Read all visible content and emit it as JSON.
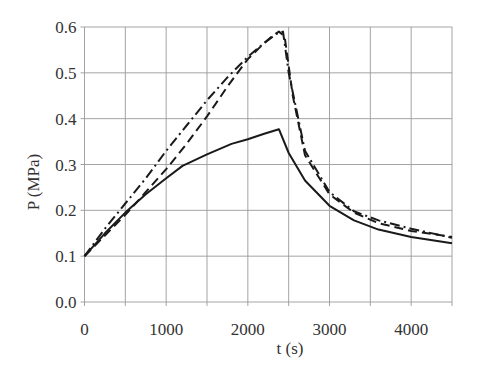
{
  "chart_data": {
    "type": "line",
    "title": "",
    "xlabel": "t (s)",
    "ylabel": "P (MPa)",
    "xlim": [
      0,
      4500
    ],
    "ylim": [
      0.0,
      0.6
    ],
    "x_ticks": [
      "0",
      "1000",
      "2000",
      "3000",
      "4000"
    ],
    "y_ticks": [
      "0.0",
      "0.1",
      "0.2",
      "0.3",
      "0.4",
      "0.5",
      "0.6"
    ],
    "grid": true,
    "x_grid_step": 500,
    "y_grid_step": 0.1,
    "legend": null,
    "series": [
      {
        "name": "solid",
        "style": "solid",
        "x": [
          0,
          250,
          500,
          750,
          1000,
          1200,
          1500,
          1800,
          2000,
          2200,
          2380,
          2500,
          2700,
          3000,
          3300,
          3600,
          4000,
          4500
        ],
        "values": [
          0.1,
          0.15,
          0.195,
          0.235,
          0.27,
          0.297,
          0.322,
          0.345,
          0.355,
          0.367,
          0.377,
          0.325,
          0.265,
          0.21,
          0.178,
          0.158,
          0.142,
          0.128
        ]
      },
      {
        "name": "dash-dot",
        "style": "dashdot",
        "x": [
          0,
          250,
          500,
          750,
          1000,
          1250,
          1500,
          1750,
          2000,
          2200,
          2350,
          2430,
          2500,
          2700,
          3000,
          3300,
          3600,
          4000,
          4500
        ],
        "values": [
          0.1,
          0.16,
          0.215,
          0.27,
          0.33,
          0.385,
          0.44,
          0.49,
          0.535,
          0.565,
          0.585,
          0.59,
          0.5,
          0.33,
          0.24,
          0.198,
          0.178,
          0.16,
          0.14
        ]
      },
      {
        "name": "dashed",
        "style": "dashed",
        "x": [
          0,
          250,
          500,
          750,
          1000,
          1250,
          1500,
          1750,
          2000,
          2200,
          2300,
          2380,
          2450,
          2550,
          2700,
          3000,
          3300,
          3600,
          4000,
          4500
        ],
        "values": [
          0.1,
          0.145,
          0.19,
          0.24,
          0.29,
          0.345,
          0.405,
          0.47,
          0.53,
          0.565,
          0.58,
          0.59,
          0.58,
          0.45,
          0.32,
          0.235,
          0.195,
          0.172,
          0.155,
          0.142
        ]
      }
    ]
  }
}
